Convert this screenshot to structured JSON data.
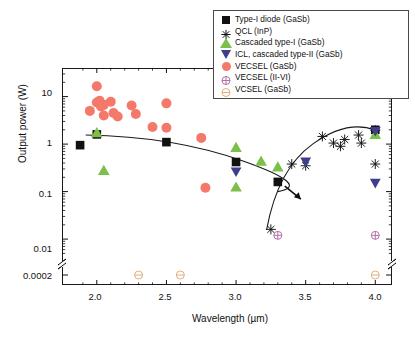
{
  "chart_data": {
    "type": "scatter",
    "title": "",
    "xlabel": "Wavelength (µm)",
    "ylabel": "Output power (W)",
    "xlim": [
      1.75,
      4.12
    ],
    "ylim_log": [
      0.004,
      40
    ],
    "yscale": "log",
    "axis_break": true,
    "axis_break_note": "y-axis broken between 0.01 and 0.0002",
    "xticks": [
      2.0,
      2.5,
      3.0,
      3.5,
      4.0
    ],
    "xticklabels": [
      "2.0",
      "2.5",
      "3.0",
      "3.5",
      "4.0"
    ],
    "yticks": [
      10,
      1,
      0.1,
      0.01,
      0.0002
    ],
    "yticklabels": [
      "10",
      "1",
      "0.1",
      "0.01",
      "0.0002"
    ],
    "grid": false,
    "legend_position": "top-right",
    "series": [
      {
        "name": "Type-I diode (GaSb)",
        "marker": "filled-square",
        "color": "#111111",
        "points": [
          [
            1.88,
            0.95
          ],
          [
            2.0,
            1.6
          ],
          [
            2.5,
            1.1
          ],
          [
            3.0,
            0.42
          ],
          [
            3.3,
            0.16
          ],
          [
            4.0,
            2.0
          ]
        ]
      },
      {
        "name": "QCL (InP)",
        "marker": "asterisk",
        "color": "#111111",
        "points": [
          [
            3.25,
            0.016
          ],
          [
            3.4,
            0.38
          ],
          [
            3.5,
            0.35
          ],
          [
            3.62,
            1.45
          ],
          [
            3.7,
            1.05
          ],
          [
            3.75,
            0.9
          ],
          [
            3.78,
            1.25
          ],
          [
            3.88,
            1.55
          ],
          [
            3.9,
            1.05
          ],
          [
            4.0,
            1.95
          ],
          [
            4.0,
            0.38
          ]
        ]
      },
      {
        "name": "Cascaded type-I (GaSb)",
        "marker": "filled-triangle-up",
        "color": "#7cc04a",
        "points": [
          [
            2.0,
            1.75
          ],
          [
            2.05,
            0.28
          ],
          [
            3.0,
            0.85
          ],
          [
            3.0,
            0.125
          ],
          [
            3.18,
            0.44
          ],
          [
            3.3,
            0.33
          ],
          [
            4.0,
            1.6
          ]
        ]
      },
      {
        "name": "ICL, cascaded type-II (GaSb)",
        "marker": "filled-triangle-down",
        "color": "#3e3e8c",
        "points": [
          [
            3.0,
            0.26
          ],
          [
            3.5,
            0.42
          ],
          [
            4.0,
            0.15
          ],
          [
            4.0,
            1.85
          ]
        ]
      },
      {
        "name": "VECSEL (GaSb)",
        "marker": "filled-circle",
        "color": "#f4796b",
        "points": [
          [
            1.95,
            5.0
          ],
          [
            2.0,
            16.5
          ],
          [
            2.0,
            7.5
          ],
          [
            2.02,
            8.2
          ],
          [
            2.03,
            6.2
          ],
          [
            2.05,
            6.7
          ],
          [
            2.05,
            4.0
          ],
          [
            2.1,
            7.8
          ],
          [
            2.12,
            4.5
          ],
          [
            2.15,
            3.8
          ],
          [
            2.25,
            6.5
          ],
          [
            2.28,
            4.3
          ],
          [
            2.4,
            2.3
          ],
          [
            2.5,
            7.2
          ],
          [
            2.5,
            2.2
          ],
          [
            2.75,
            1.35
          ],
          [
            2.78,
            0.12
          ]
        ]
      },
      {
        "name": "VECSEL (II-VI)",
        "marker": "circle-plus",
        "color": "#b36fa8",
        "points": [
          [
            3.3,
            0.012
          ],
          [
            4.0,
            0.012
          ]
        ]
      },
      {
        "name": "VCSEL (GaSb)",
        "marker": "circle-minus",
        "color": "#e2b07a",
        "points": [
          [
            2.3,
            0.0002
          ],
          [
            2.6,
            0.0002
          ],
          [
            4.0,
            0.0002
          ]
        ]
      }
    ],
    "annotations": [
      {
        "type": "arrow",
        "x": 3.35,
        "y": 0.13,
        "direction": "down-right"
      },
      {
        "type": "envelope-curve",
        "label": "interband envelope"
      },
      {
        "type": "envelope-curve",
        "label": "QCL envelope"
      }
    ]
  },
  "legend": {
    "entries": [
      {
        "label": "Type-I diode (GaSb)",
        "icon": "filled-square-icon"
      },
      {
        "label": "QCL (InP)",
        "icon": "asterisk-icon"
      },
      {
        "label": "Cascaded type-I (GaSb)",
        "icon": "triangle-up-icon"
      },
      {
        "label": "ICL, cascaded type-II (GaSb)",
        "icon": "triangle-down-icon"
      },
      {
        "label": "VECSEL (GaSb)",
        "icon": "filled-circle-icon"
      },
      {
        "label": "VECSEL (II-VI)",
        "icon": "circle-plus-icon"
      },
      {
        "label": "VCSEL (GaSb)",
        "icon": "circle-minus-icon"
      }
    ]
  },
  "axes": {
    "x_title": "Wavelength (µm)",
    "y_title": "Output power (W)",
    "x_ticklabels": [
      "2.0",
      "2.5",
      "3.0",
      "3.5",
      "4.0"
    ],
    "y_ticklabels": [
      "10",
      "1",
      "0.1",
      "0.01",
      "0.0002"
    ]
  }
}
